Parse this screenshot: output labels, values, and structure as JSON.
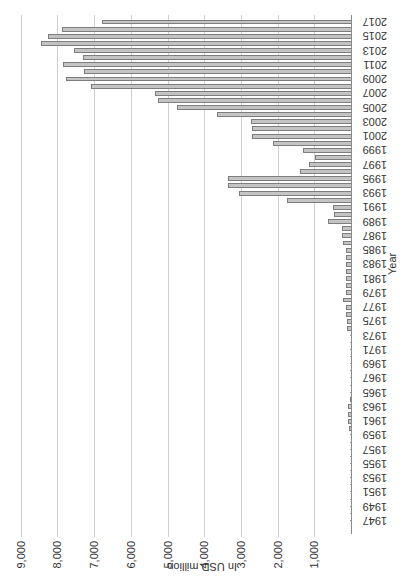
{
  "chart_data": {
    "type": "bar",
    "orientation": "vertical bars, image rotated 90 degrees",
    "title": "",
    "xlabel": "Year",
    "ylabel": "In USD million",
    "ylim": [
      0,
      9000
    ],
    "yticks": [
      1000,
      2000,
      3000,
      4000,
      5000,
      6000,
      7000,
      8000,
      9000
    ],
    "ytick_labels": [
      "1,000",
      "2,000",
      "3,000",
      "4,000",
      "5,000",
      "6,000",
      "7,000",
      "8,000",
      "9,000"
    ],
    "xtick_labels": [
      "1947",
      "1949",
      "1951",
      "1953",
      "1955",
      "1957",
      "1959",
      "1961",
      "1963",
      "1965",
      "1967",
      "1969",
      "1971",
      "1973",
      "1975",
      "1977",
      "1979",
      "1981",
      "1983",
      "1985",
      "1987",
      "1989",
      "1991",
      "1993",
      "1995",
      "1997",
      "1999",
      "2001",
      "2003",
      "2005",
      "2007",
      "2009",
      "2011",
      "2013",
      "2015",
      "2017"
    ],
    "grid": true,
    "legend": null,
    "categories": [
      1947,
      1948,
      1949,
      1950,
      1951,
      1952,
      1953,
      1954,
      1955,
      1956,
      1957,
      1958,
      1959,
      1960,
      1961,
      1962,
      1963,
      1964,
      1965,
      1966,
      1967,
      1968,
      1969,
      1970,
      1971,
      1972,
      1973,
      1974,
      1975,
      1976,
      1977,
      1978,
      1979,
      1980,
      1981,
      1982,
      1983,
      1984,
      1985,
      1986,
      1987,
      1988,
      1989,
      1990,
      1991,
      1992,
      1993,
      1994,
      1995,
      1996,
      1997,
      1998,
      1999,
      2000,
      2001,
      2002,
      2003,
      2004,
      2005,
      2006,
      2007,
      2008,
      2009,
      2010,
      2011,
      2012,
      2013,
      2014,
      2015,
      2016,
      2017
    ],
    "values": [
      5,
      5,
      5,
      5,
      5,
      5,
      5,
      10,
      10,
      10,
      10,
      20,
      20,
      50,
      90,
      80,
      90,
      30,
      20,
      20,
      20,
      20,
      20,
      20,
      20,
      20,
      20,
      100,
      120,
      140,
      140,
      230,
      140,
      140,
      140,
      140,
      140,
      140,
      140,
      230,
      250,
      250,
      640,
      460,
      500,
      1750,
      3050,
      3350,
      3350,
      1390,
      1140,
      980,
      1310,
      2130,
      2700,
      2700,
      2720,
      3650,
      4750,
      5250,
      5340,
      7080,
      7770,
      7270,
      7840,
      7310,
      7540,
      8460,
      8250,
      7870,
      6790
    ],
    "colors": {
      "bar_fill": "#c4c4c4",
      "bar_edge": "#7d7d7d",
      "grid": "#cfcfcf"
    }
  }
}
